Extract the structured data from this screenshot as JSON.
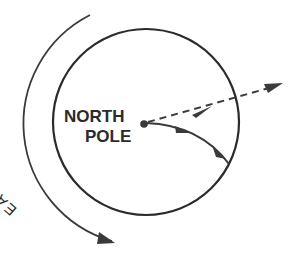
{
  "diagram": {
    "pole_label_line1": "NORTH",
    "pole_label_line2": "POLE",
    "rotation_label": "EARTH'S ROTATION",
    "elements": {
      "globe_circle": "circle representing Earth viewed from above the North Pole",
      "rotation_arrow": "counter-clockwise curved arrow labeled Earth's rotation",
      "intended_path": "dashed straight arrow from the pole outward",
      "deflected_path": "solid curved arrow deflected to the right"
    },
    "colors": {
      "stroke": "#2b2b2b",
      "background": "#ffffff"
    }
  }
}
